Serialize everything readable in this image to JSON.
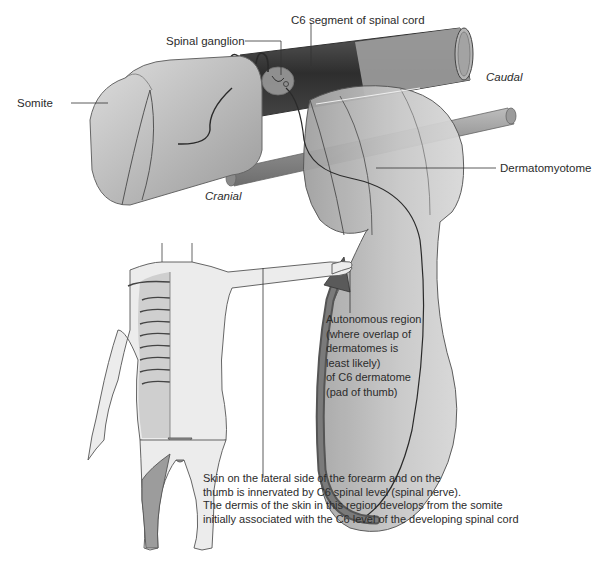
{
  "diagram": {
    "labels": {
      "spinal_ganglion": "Spinal ganglion",
      "c6_segment": "C6 segment of spinal cord",
      "somite": "Somite",
      "caudal": "Caudal",
      "cranial": "Cranial",
      "dermatomyotome": "Dermatomyotome",
      "autonomous_region": "Autonomous region\n(where overlap of\ndermatomes is\nleast likely)\nof C6 dermatome\n(pad of thumb)",
      "caption": "Skin on the lateral side of the forearm and on the\nthumb is innervated by C6 spinal level (spinal nerve).\nThe dermis of the skin in this region develops from the somite\ninitially associated with the C6 level of the developing spinal cord"
    },
    "colors": {
      "spinal_cord_dark": "#3a3a3a",
      "tissue_light": "#d4d4d4",
      "tissue_mid": "#a8a8a8",
      "dermatome_dark": "#6e6e6e",
      "leader_line": "#333333"
    }
  }
}
